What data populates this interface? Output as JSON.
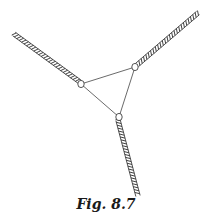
{
  "figure": {
    "caption": "Fig. 8.7",
    "ropes": [
      {
        "name": "rope-upper-left"
      },
      {
        "name": "rope-upper-right"
      },
      {
        "name": "rope-bottom"
      }
    ],
    "rings": [
      {
        "name": "ring-left"
      },
      {
        "name": "ring-right"
      },
      {
        "name": "ring-bottom"
      }
    ],
    "colors": {
      "ink": "#2a2a2a",
      "background": "#ffffff"
    }
  }
}
